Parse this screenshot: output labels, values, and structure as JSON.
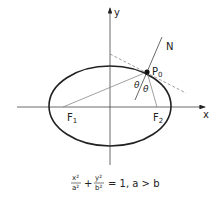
{
  "diagram": {
    "axes": {
      "x_label": "x",
      "y_label": "y"
    },
    "points": {
      "f1": {
        "label": "F",
        "sub": "1"
      },
      "f2": {
        "label": "F",
        "sub": "2"
      },
      "p0": {
        "label": "P",
        "sub": "0"
      }
    },
    "normal_label": "N",
    "angle_labels": [
      "θ",
      "θ"
    ],
    "equation": {
      "term1_num": "x²",
      "term1_den": "a²",
      "plus": "+",
      "term2_num": "y²",
      "term2_den": "b²",
      "rest": "= 1, a > b"
    },
    "colors": {
      "stroke": "#222222",
      "gray_line": "#888888"
    }
  }
}
